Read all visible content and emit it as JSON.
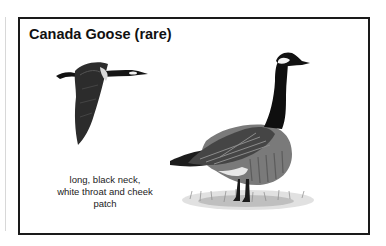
{
  "card": {
    "title": "Canada Goose (rare)",
    "caption_lines": [
      "long, black neck,",
      "white throat and cheek",
      "patch"
    ]
  },
  "illustrations": {
    "flying_goose": "flying Canada goose illustration",
    "standing_goose": "standing Canada goose illustration"
  },
  "colors": {
    "border": "#1a1a1a",
    "text": "#111111",
    "neck": "#0d0d0d",
    "body": "#6e6e6e",
    "wing": "#3a3a3a",
    "grass": "#9a9a9a"
  }
}
